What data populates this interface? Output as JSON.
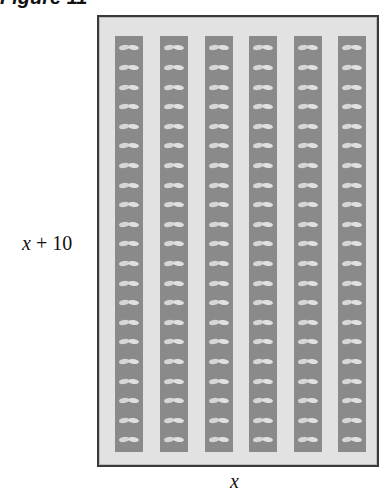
{
  "figure": {
    "title": "Figure 11",
    "side_label_var": "x",
    "side_label_rest": " + 10",
    "bottom_label": "x",
    "columns": 6,
    "plants_per_column": 21,
    "colors": {
      "background": "#e2e2e2",
      "strip": "#8a8a8a",
      "plant": "#d6d6d6",
      "border": "#3a3a3a"
    }
  }
}
